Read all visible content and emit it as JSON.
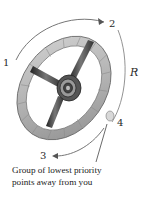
{
  "diagram": {
    "labels": {
      "p1": "1",
      "p2": "2",
      "p3": "3",
      "p4": "4",
      "radius": "R"
    },
    "caption": {
      "line1": "Group of lowest priority",
      "line2": "points away from you"
    },
    "colors": {
      "rim": "#b8b8b8",
      "rim_dark": "#7a7a7a",
      "spoke": "#3a3a3a",
      "hub": "#555555",
      "arrow": "#555555",
      "text": "#222222"
    }
  }
}
